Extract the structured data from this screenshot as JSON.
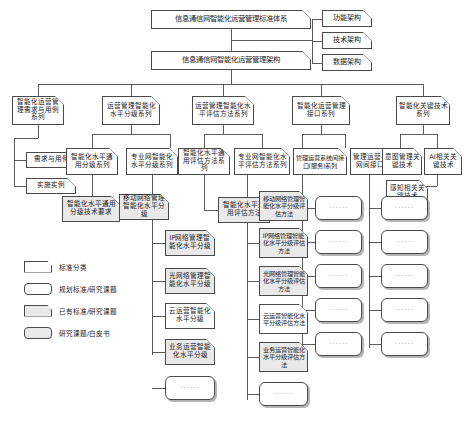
{
  "diagram": {
    "title_top": "信息通信网智能化运营管理标准体系",
    "title_second": "信息通信网智能化运营管理架构",
    "architecture_branches": [
      {
        "label": "功能架构"
      },
      {
        "label": "技术架构"
      },
      {
        "label": "数据架构"
      }
    ],
    "categories": [
      {
        "label": "智能化运营管理需求与用例系列"
      },
      {
        "label": "运营管理智能化水平分级系列"
      },
      {
        "label": "运营管理智能化水平评估方法系列"
      },
      {
        "label": "智能化运营管理接口系列"
      },
      {
        "label": "智能化关键技术系列"
      }
    ],
    "subheads": [
      {
        "label": "需求与用例"
      },
      {
        "label": "实施实例"
      },
      {
        "label": "智能化水平通用分级系列"
      },
      {
        "label": "专业网智能化水平分级系列"
      },
      {
        "label": "智能化水平通用评估方法系列"
      },
      {
        "label": "专业网智能化水平评估方法系列"
      },
      {
        "label": "管理运营系统间接口(服务)系列"
      },
      {
        "label": "管理运营与专业网间接口系列"
      },
      {
        "label": "意图管理关键技术"
      },
      {
        "label": "AI相关关键技术"
      },
      {
        "label": "感知相关关键技术"
      }
    ],
    "col_general_grading": [
      {
        "label": "智能化水平通用分级技术要求"
      }
    ],
    "col_professional_grading": [
      {
        "label": "移动网络管理智能化水平分级"
      },
      {
        "label": "IP网络管理智能化水平分级"
      },
      {
        "label": "光网络管理智能化水平分级"
      },
      {
        "label": "云运营智能化水平分级"
      },
      {
        "label": "业务运营智能化水平分级"
      },
      {
        "label": "······"
      }
    ],
    "col_general_assessment": [
      {
        "label": "智能化水平通用评估方法"
      }
    ],
    "col_professional_assessment": [
      {
        "label": "移动网络管理智能化水平分级评估方法"
      },
      {
        "label": "IP网络管理智能化水平分级评估方法"
      },
      {
        "label": "光网络管理智能化水平分级评估方法"
      },
      {
        "label": "云运营智能化水平分级评估方法"
      },
      {
        "label": "业务运营智能化水平分级评估方法"
      },
      {
        "label": "······"
      }
    ],
    "col_interface_system": [
      {
        "label": "······"
      },
      {
        "label": "······"
      },
      {
        "label": "······"
      },
      {
        "label": "······"
      },
      {
        "label": "······"
      }
    ],
    "col_interface_professional": [
      {
        "label": "······"
      },
      {
        "label": "······"
      },
      {
        "label": "······"
      },
      {
        "label": "······"
      },
      {
        "label": "······"
      }
    ],
    "legend": [
      {
        "label": "标准分类",
        "style": "fold-white"
      },
      {
        "label": "规划标准/研究课题",
        "style": "round-white"
      },
      {
        "label": "已有标准/研究课题",
        "style": "fold-gray"
      },
      {
        "label": "研究课题/白皮书",
        "style": "round-gray"
      }
    ],
    "colors": {
      "line": "#4a4a4a",
      "fill_white": "#ffffff",
      "fill_gray": "#e9e9e9",
      "background": "#ffffff"
    }
  }
}
